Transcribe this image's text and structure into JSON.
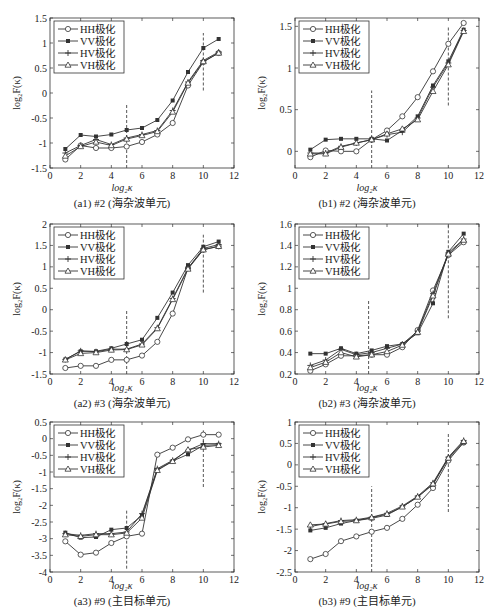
{
  "legend_labels": [
    "HH极化",
    "VV极化",
    "HV极化",
    "VH极化"
  ],
  "markers": [
    "circle",
    "star",
    "plus",
    "triangle"
  ],
  "x_axis_label": "log₂κ",
  "y_axis_label": "log₂F(κ)",
  "line_color": "#333333",
  "dashed_line_color": "#444444",
  "chart_data": [
    {
      "id": "a1",
      "type": "line",
      "title": "(a1) #2 (海杂波单元)",
      "xlabel": "log₂κ",
      "ylabel": "log₂F(κ)",
      "xlim": [
        0,
        12
      ],
      "ylim": [
        -1.5,
        1.5
      ],
      "xticks": [
        0,
        2,
        4,
        6,
        8,
        10,
        12
      ],
      "yticks": [
        -1.5,
        -1,
        -0.5,
        0,
        0.5,
        1,
        1.5
      ],
      "ytick_labels": [
        "-1.5",
        "-1",
        "-0.5",
        "0",
        "0.5",
        "1",
        "1.5"
      ],
      "x": [
        1,
        2,
        3,
        4,
        5,
        6,
        7,
        8,
        9,
        10,
        11
      ],
      "series": [
        {
          "name": "HH极化",
          "values": [
            -1.33,
            -1.05,
            -1.1,
            -1.1,
            -1.07,
            -0.98,
            -0.83,
            -0.6,
            0.15,
            0.62,
            0.8
          ]
        },
        {
          "name": "VV极化",
          "values": [
            -1.12,
            -0.84,
            -0.87,
            -0.83,
            -0.74,
            -0.7,
            -0.54,
            -0.15,
            0.42,
            0.9,
            1.08
          ]
        },
        {
          "name": "HV极化",
          "values": [
            -1.2,
            -1.05,
            -0.93,
            -1.03,
            -0.9,
            -0.83,
            -0.75,
            -0.35,
            0.22,
            0.65,
            0.82
          ]
        },
        {
          "name": "VH极化",
          "values": [
            -1.26,
            -1.07,
            -0.98,
            -1.05,
            -0.92,
            -0.85,
            -0.77,
            -0.38,
            0.2,
            0.63,
            0.8
          ]
        }
      ],
      "vlines": [
        {
          "x": 5,
          "y0": -1.5,
          "y1": -0.2
        },
        {
          "x": 10,
          "y0": 0.05,
          "y1": 1.2
        }
      ],
      "legend_position": "upper left",
      "grid": false
    },
    {
      "id": "b1",
      "type": "line",
      "title": "(b1) #2 (海杂波单元)",
      "xlabel": "log₂κ",
      "ylabel": "log₂F(κ)",
      "xlim": [
        0,
        12
      ],
      "ylim": [
        -0.2,
        1.6
      ],
      "xticks": [
        0,
        2,
        4,
        6,
        8,
        10,
        12
      ],
      "yticks": [
        0,
        0.5,
        1,
        1.5
      ],
      "ytick_labels": [
        "0",
        "0.5",
        "1",
        "1.5"
      ],
      "x": [
        1,
        2,
        3,
        4,
        5,
        6,
        7,
        8,
        9,
        10,
        11
      ],
      "series": [
        {
          "name": "HH极化",
          "values": [
            -0.07,
            0.01,
            0.0,
            0.0,
            0.14,
            0.25,
            0.42,
            0.65,
            0.96,
            1.29,
            1.54
          ]
        },
        {
          "name": "VV极化",
          "values": [
            0.02,
            0.14,
            0.15,
            0.15,
            0.15,
            0.13,
            0.25,
            0.42,
            0.79,
            1.08,
            1.46
          ]
        },
        {
          "name": "HV极化",
          "values": [
            -0.02,
            -0.02,
            0.06,
            0.1,
            0.14,
            0.2,
            0.23,
            0.4,
            0.77,
            1.06,
            1.45
          ]
        },
        {
          "name": "VH极化",
          "values": [
            -0.03,
            -0.03,
            0.05,
            0.1,
            0.14,
            0.21,
            0.27,
            0.38,
            0.72,
            1.04,
            1.44
          ]
        }
      ],
      "vlines": [
        {
          "x": 5,
          "y0": -0.2,
          "y1": 0.73
        },
        {
          "x": 10,
          "y0": 0.55,
          "y1": 1.5
        }
      ],
      "legend_position": "upper left",
      "grid": false
    },
    {
      "id": "a2",
      "type": "line",
      "title": "(a2) #3 (海杂波单元)",
      "xlabel": "log₂κ",
      "ylabel": "log₂F(κ)",
      "xlim": [
        0,
        12
      ],
      "ylim": [
        -1.5,
        2
      ],
      "xticks": [
        0,
        2,
        4,
        6,
        8,
        10,
        12
      ],
      "yticks": [
        -1.5,
        -1,
        -0.5,
        0,
        0.5,
        1,
        1.5,
        2
      ],
      "ytick_labels": [
        "-1.5",
        "-1",
        "-0.5",
        "0",
        "0.5",
        "1",
        "1.5",
        "2"
      ],
      "x": [
        1,
        2,
        3,
        4,
        5,
        6,
        7,
        8,
        9,
        10,
        11
      ],
      "series": [
        {
          "name": "HH极化",
          "values": [
            -1.36,
            -1.31,
            -1.31,
            -1.17,
            -1.17,
            -1.07,
            -0.75,
            -0.09,
            0.97,
            1.4,
            1.48
          ]
        },
        {
          "name": "VV极化",
          "values": [
            -1.16,
            -0.97,
            -0.97,
            -0.9,
            -0.8,
            -0.7,
            -0.19,
            0.4,
            1.04,
            1.47,
            1.59
          ]
        },
        {
          "name": "HV极化",
          "values": [
            -1.16,
            -0.96,
            -0.98,
            -0.92,
            -0.92,
            -0.8,
            -0.42,
            0.26,
            0.97,
            1.43,
            1.52
          ]
        },
        {
          "name": "VH极化",
          "values": [
            -1.17,
            -1.02,
            -1.0,
            -0.94,
            -0.93,
            -0.82,
            -0.44,
            0.24,
            0.95,
            1.4,
            1.48
          ]
        }
      ],
      "vlines": [
        {
          "x": 5,
          "y0": -1.5,
          "y1": 0.0
        },
        {
          "x": 10,
          "y0": 0.4,
          "y1": 1.75
        }
      ],
      "legend_position": "upper left",
      "grid": false
    },
    {
      "id": "b2",
      "type": "line",
      "title": "(b2) #3 (海杂波单元)",
      "xlabel": "log₂κ",
      "ylabel": "log₂F(κ)",
      "xlim": [
        0,
        12
      ],
      "ylim": [
        0.2,
        1.6
      ],
      "xticks": [
        0,
        2,
        4,
        6,
        8,
        10,
        12
      ],
      "yticks": [
        0.2,
        0.4,
        0.6,
        0.8,
        1,
        1.2,
        1.4,
        1.6
      ],
      "ytick_labels": [
        "0.2",
        "0.4",
        "0.6",
        "0.8",
        "1",
        "1.2",
        "1.4",
        "1.6"
      ],
      "x": [
        1,
        2,
        3,
        4,
        5,
        6,
        7,
        8,
        9,
        10,
        11
      ],
      "series": [
        {
          "name": "HH极化",
          "values": [
            0.23,
            0.29,
            0.37,
            0.37,
            0.38,
            0.38,
            0.45,
            0.61,
            0.98,
            1.31,
            1.43
          ]
        },
        {
          "name": "VV极化",
          "values": [
            0.39,
            0.39,
            0.44,
            0.39,
            0.42,
            0.46,
            0.48,
            0.58,
            0.86,
            1.34,
            1.51
          ]
        },
        {
          "name": "HV极化",
          "values": [
            0.28,
            0.33,
            0.43,
            0.38,
            0.4,
            0.44,
            0.48,
            0.6,
            0.95,
            1.33,
            1.46
          ]
        },
        {
          "name": "VH极化",
          "values": [
            0.26,
            0.31,
            0.4,
            0.36,
            0.38,
            0.41,
            0.47,
            0.59,
            0.93,
            1.32,
            1.45
          ]
        }
      ],
      "vlines": [
        {
          "x": 4.8,
          "y0": 0.2,
          "y1": 0.9
        },
        {
          "x": 10,
          "y0": 0.72,
          "y1": 1.6
        }
      ],
      "legend_position": "upper left",
      "grid": false
    },
    {
      "id": "a3",
      "type": "line",
      "title": "(a3) #9 (主目标单元)",
      "xlabel": "log₂κ",
      "ylabel": "log₂F(κ)",
      "xlim": [
        0,
        12
      ],
      "ylim": [
        -4,
        0.5
      ],
      "xticks": [
        0,
        2,
        4,
        6,
        8,
        10,
        12
      ],
      "yticks": [
        -4,
        -3.5,
        -3,
        -2.5,
        -2,
        -1.5,
        -1,
        -0.5,
        0,
        0.5
      ],
      "ytick_labels": [
        "-4",
        "-3.5",
        "-3",
        "-2.5",
        "-2",
        "-1.5",
        "-1",
        "-0.5",
        "0",
        "0.5"
      ],
      "x": [
        1,
        2,
        3,
        4,
        5,
        6,
        7,
        8,
        9,
        10,
        11
      ],
      "series": [
        {
          "name": "HH极化",
          "values": [
            -3.08,
            -3.48,
            -3.42,
            -3.13,
            -2.93,
            -2.85,
            -0.48,
            -0.27,
            -0.02,
            0.12,
            0.12
          ]
        },
        {
          "name": "VV极化",
          "values": [
            -2.82,
            -2.97,
            -2.95,
            -2.73,
            -2.68,
            -2.3,
            -0.93,
            -0.67,
            -0.47,
            -0.2,
            -0.18
          ]
        },
        {
          "name": "HV极化",
          "values": [
            -2.85,
            -2.9,
            -2.85,
            -2.85,
            -2.8,
            -2.25,
            -0.9,
            -0.65,
            -0.35,
            -0.15,
            -0.15
          ]
        },
        {
          "name": "VH极化",
          "values": [
            -2.88,
            -2.93,
            -2.88,
            -2.88,
            -2.83,
            -2.38,
            -0.95,
            -0.68,
            -0.33,
            -0.25,
            -0.2
          ]
        }
      ],
      "vlines": [
        {
          "x": 5,
          "y0": -3.9,
          "y1": -2.1
        },
        {
          "x": 10,
          "y0": -1.45,
          "y1": 0.25
        }
      ],
      "legend_position": "upper left",
      "grid": false
    },
    {
      "id": "b3",
      "type": "line",
      "title": "(b3) #9 (主目标单元)",
      "xlabel": "log₂κ",
      "ylabel": "log₂F(κ)",
      "xlim": [
        0,
        12
      ],
      "ylim": [
        -2.5,
        1
      ],
      "xticks": [
        0,
        2,
        4,
        6,
        8,
        10,
        12
      ],
      "yticks": [
        -2.5,
        -2,
        -1.5,
        -1,
        -0.5,
        0,
        0.5,
        1
      ],
      "ytick_labels": [
        "-2.5",
        "-2",
        "-1.5",
        "-1",
        "-0.5",
        "0",
        "0.5",
        "1"
      ],
      "x": [
        1,
        2,
        3,
        4,
        5,
        6,
        7,
        8,
        9,
        10,
        11
      ],
      "series": [
        {
          "name": "HH极化",
          "values": [
            -2.2,
            -2.08,
            -1.78,
            -1.67,
            -1.56,
            -1.47,
            -1.26,
            -0.93,
            -0.54,
            0.1,
            0.52
          ]
        },
        {
          "name": "VV极化",
          "values": [
            -1.53,
            -1.47,
            -1.37,
            -1.3,
            -1.25,
            -1.17,
            -0.98,
            -0.75,
            -0.46,
            0.15,
            0.52
          ]
        },
        {
          "name": "HV极化",
          "values": [
            -1.44,
            -1.37,
            -1.3,
            -1.28,
            -1.22,
            -1.13,
            -0.96,
            -0.73,
            -0.42,
            0.18,
            0.57
          ]
        },
        {
          "name": "VH极化",
          "values": [
            -1.4,
            -1.38,
            -1.32,
            -1.3,
            -1.23,
            -1.15,
            -0.98,
            -0.75,
            -0.44,
            0.16,
            0.55
          ]
        }
      ],
      "vlines": [
        {
          "x": 5,
          "y0": -2.5,
          "y1": -0.5
        },
        {
          "x": 10,
          "y0": -1.1,
          "y1": 0.75
        }
      ],
      "legend_position": "upper left",
      "grid": false
    }
  ]
}
